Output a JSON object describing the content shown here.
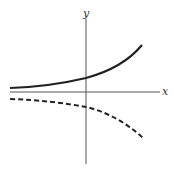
{
  "diagram": {
    "axes": {
      "x_label": "x",
      "y_label": "y"
    },
    "curves": [
      {
        "name": "solid-curve",
        "style": "solid",
        "description": "increasing exponential above x-axis"
      },
      {
        "name": "dashed-curve",
        "style": "dashed",
        "description": "reflection of exponential below x-axis"
      }
    ],
    "colors": {
      "axis": "#555555",
      "curve": "#222222"
    }
  }
}
